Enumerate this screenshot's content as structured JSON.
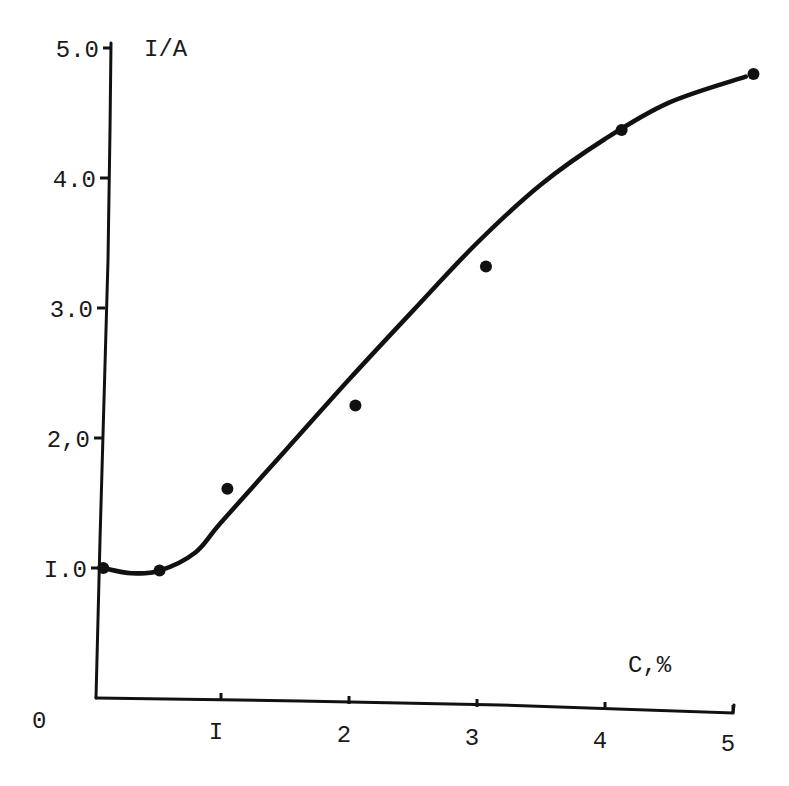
{
  "chart_data": {
    "type": "scatter",
    "title": "",
    "xlabel": "C,%",
    "ylabel": "I/A",
    "origin_label": "0",
    "xlim": [
      0,
      5.2
    ],
    "ylim": [
      0,
      5.0
    ],
    "grid": false,
    "legend": null,
    "x_ticks": [
      {
        "value": 1,
        "label": "I"
      },
      {
        "value": 2,
        "label": "2"
      },
      {
        "value": 3,
        "label": "3"
      },
      {
        "value": 4,
        "label": "4"
      },
      {
        "value": 5,
        "label": "5"
      }
    ],
    "y_ticks": [
      {
        "value": 1.0,
        "label": "I.0"
      },
      {
        "value": 2.0,
        "label": "2,0"
      },
      {
        "value": 3.0,
        "label": "3.0"
      },
      {
        "value": 4.0,
        "label": "4.0"
      },
      {
        "value": 5.0,
        "label": "5.0"
      }
    ],
    "series": [
      {
        "name": "measured points",
        "type": "scatter",
        "x": [
          0.08,
          0.52,
          1.05,
          2.05,
          3.07,
          4.13,
          5.16
        ],
        "y": [
          1.0,
          0.98,
          1.61,
          2.25,
          3.32,
          4.37,
          4.8
        ]
      },
      {
        "name": "fitted curve",
        "type": "line",
        "x": [
          0.08,
          0.3,
          0.52,
          0.8,
          1.0,
          1.5,
          2.0,
          2.5,
          3.0,
          3.5,
          4.0,
          4.5,
          5.1
        ],
        "y": [
          1.0,
          0.96,
          0.98,
          1.12,
          1.35,
          1.9,
          2.45,
          2.98,
          3.5,
          3.95,
          4.3,
          4.58,
          4.78
        ]
      }
    ]
  }
}
